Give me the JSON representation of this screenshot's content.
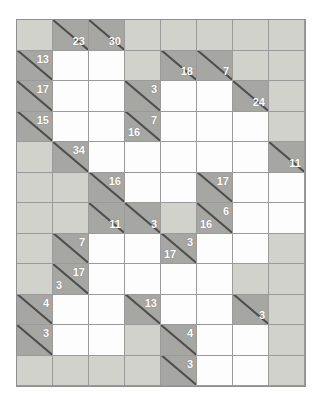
{
  "puzzle": {
    "name": "kakuro-grid",
    "columns": 8,
    "rows": 12,
    "colors": {
      "background": "#ffffff",
      "light_block": "#d2d2cd",
      "dark_block": "#a6a6a2",
      "entry_cell": "#fdfdfd",
      "grid_line": "#9a9a9a",
      "frame_line": "#8f8f8f",
      "clue_text": "#ffffff",
      "diagonal": "#4d4d4d"
    },
    "cells": [
      [
        {
          "type": "light"
        },
        {
          "type": "dark",
          "diag": true,
          "across": "23"
        },
        {
          "type": "dark",
          "diag": true,
          "across": "30"
        },
        {
          "type": "light"
        },
        {
          "type": "light"
        },
        {
          "type": "light"
        },
        {
          "type": "light"
        },
        {
          "type": "light"
        }
      ],
      [
        {
          "type": "dark",
          "diag": true,
          "down": "13"
        },
        {
          "type": "white"
        },
        {
          "type": "white"
        },
        {
          "type": "light"
        },
        {
          "type": "dark",
          "diag": true,
          "across": "18"
        },
        {
          "type": "dark",
          "diag": true,
          "across": "7"
        },
        {
          "type": "light"
        },
        {
          "type": "light"
        }
      ],
      [
        {
          "type": "dark",
          "diag": true,
          "down": "17"
        },
        {
          "type": "white"
        },
        {
          "type": "white"
        },
        {
          "type": "dark",
          "diag": true,
          "down": "3"
        },
        {
          "type": "white"
        },
        {
          "type": "white"
        },
        {
          "type": "dark",
          "diag": true,
          "across": "24"
        },
        {
          "type": "light"
        }
      ],
      [
        {
          "type": "dark",
          "diag": true,
          "down": "15"
        },
        {
          "type": "white"
        },
        {
          "type": "white"
        },
        {
          "type": "dark",
          "diag": true,
          "down": "7",
          "across": "16"
        },
        {
          "type": "white"
        },
        {
          "type": "white"
        },
        {
          "type": "white"
        },
        {
          "type": "light"
        }
      ],
      [
        {
          "type": "light"
        },
        {
          "type": "dark",
          "diag": true,
          "down": "34"
        },
        {
          "type": "white"
        },
        {
          "type": "white"
        },
        {
          "type": "white"
        },
        {
          "type": "white"
        },
        {
          "type": "white"
        },
        {
          "type": "dark",
          "diag": true,
          "across": "11"
        }
      ],
      [
        {
          "type": "light"
        },
        {
          "type": "light"
        },
        {
          "type": "dark",
          "diag": true,
          "down": "16"
        },
        {
          "type": "white"
        },
        {
          "type": "white"
        },
        {
          "type": "dark",
          "diag": true,
          "down": "17"
        },
        {
          "type": "white"
        },
        {
          "type": "white"
        }
      ],
      [
        {
          "type": "light"
        },
        {
          "type": "light"
        },
        {
          "type": "dark",
          "diag": true,
          "across": "11"
        },
        {
          "type": "dark",
          "diag": true,
          "across": "3"
        },
        {
          "type": "light"
        },
        {
          "type": "dark",
          "diag": true,
          "down": "6",
          "across": "16"
        },
        {
          "type": "white"
        },
        {
          "type": "white"
        }
      ],
      [
        {
          "type": "light"
        },
        {
          "type": "dark",
          "diag": true,
          "down": "7"
        },
        {
          "type": "white"
        },
        {
          "type": "white"
        },
        {
          "type": "dark",
          "diag": true,
          "down": "3",
          "across": "17"
        },
        {
          "type": "white"
        },
        {
          "type": "white"
        },
        {
          "type": "light"
        }
      ],
      [
        {
          "type": "light"
        },
        {
          "type": "dark",
          "diag": true,
          "down": "17",
          "across": "3"
        },
        {
          "type": "white"
        },
        {
          "type": "white"
        },
        {
          "type": "white"
        },
        {
          "type": "white"
        },
        {
          "type": "light"
        },
        {
          "type": "light"
        }
      ],
      [
        {
          "type": "dark",
          "diag": true,
          "down": "4"
        },
        {
          "type": "white"
        },
        {
          "type": "white"
        },
        {
          "type": "dark",
          "diag": true,
          "down": "13"
        },
        {
          "type": "white"
        },
        {
          "type": "white"
        },
        {
          "type": "dark",
          "diag": true,
          "across": "3"
        },
        {
          "type": "light"
        }
      ],
      [
        {
          "type": "dark",
          "diag": true,
          "down": "3"
        },
        {
          "type": "white"
        },
        {
          "type": "white"
        },
        {
          "type": "light"
        },
        {
          "type": "dark",
          "diag": true,
          "down": "4"
        },
        {
          "type": "white"
        },
        {
          "type": "white"
        },
        {
          "type": "light"
        }
      ],
      [
        {
          "type": "light"
        },
        {
          "type": "light"
        },
        {
          "type": "light"
        },
        {
          "type": "light"
        },
        {
          "type": "dark",
          "diag": true,
          "down": "3"
        },
        {
          "type": "white"
        },
        {
          "type": "white"
        },
        {
          "type": "light"
        }
      ]
    ]
  }
}
